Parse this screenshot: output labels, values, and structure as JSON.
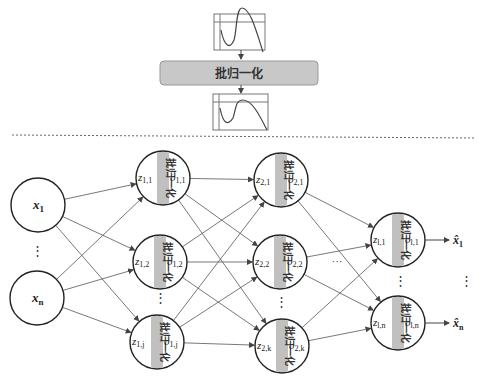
{
  "top": {
    "bn_box_label": "批归一化",
    "bn_box_color": "#c8c8c8",
    "chart_before": "distribution-before-icon",
    "chart_after": "distribution-after-icon"
  },
  "network": {
    "bn_strip_label": "批归一化",
    "bn_strip_color": "#c0c0c0",
    "inputs": [
      {
        "id": "x1",
        "label": "x",
        "sub": "1"
      },
      {
        "id": "xn",
        "label": "x",
        "sub": "n"
      }
    ],
    "layer1": [
      {
        "z": "z",
        "zsub": "1,1",
        "o": "o",
        "osub": "1,1"
      },
      {
        "z": "z",
        "zsub": "1,2",
        "o": "o",
        "osub": "1,2"
      },
      {
        "z": "z",
        "zsub": "1,j",
        "o": "o",
        "osub": "1,j"
      }
    ],
    "layer2": [
      {
        "z": "z",
        "zsub": "2,1",
        "o": "o",
        "osub": "2,1"
      },
      {
        "z": "z",
        "zsub": "2,2",
        "o": "o",
        "osub": "2,2"
      },
      {
        "z": "z",
        "zsub": "2,k",
        "o": "o",
        "osub": "2,k"
      }
    ],
    "output_layer": [
      {
        "z": "z",
        "zsub": "l,1",
        "o": "o",
        "osub": "l,1"
      },
      {
        "z": "z",
        "zsub": "l,n",
        "o": "o",
        "osub": "l,n"
      }
    ],
    "outputs": [
      {
        "label": "x̂",
        "sub": "1"
      },
      {
        "label": "x̂",
        "sub": "n"
      }
    ],
    "vdots": "⋮",
    "hdots": "···"
  }
}
